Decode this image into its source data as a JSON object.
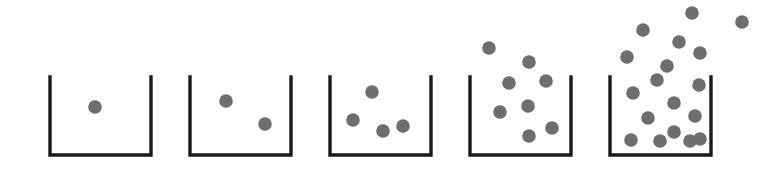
{
  "figure": {
    "width": 775,
    "height": 183,
    "background_color": "#ffffff"
  },
  "style": {
    "container_stroke_color": "#1a1a1a",
    "container_stroke_width": 3.4,
    "particle_color": "#6e6e6e",
    "particle_radius": 6.8
  },
  "chart_data": {
    "type": "scatter",
    "xlabel": "",
    "ylabel": "",
    "grid": false,
    "legend": null,
    "categories": [
      "Container 1",
      "Container 2",
      "Container 3",
      "Container 4",
      "Container 5"
    ],
    "series": [
      {
        "name": "Particles inside container",
        "values": [
          1,
          2,
          4,
          6,
          11
        ]
      },
      {
        "name": "Particles escaped above rim",
        "values": [
          0,
          0,
          0,
          2,
          7
        ]
      },
      {
        "name": "Total particles",
        "values": [
          1,
          2,
          4,
          8,
          18
        ]
      }
    ],
    "axis_note": "No axes drawn; quantities read by counting drawn particles."
  },
  "containers": [
    {
      "label": "Container 1",
      "particle_count_total": 1,
      "particle_count_inside": 1,
      "particle_count_escaped": 0,
      "box": {
        "left": 50,
        "right": 151,
        "top": 77,
        "bottom": 155
      },
      "particles_inside": [
        {
          "cx": 95,
          "cy": 107
        }
      ],
      "particles_escaped": []
    },
    {
      "label": "Container 2",
      "particle_count_total": 2,
      "particle_count_inside": 2,
      "particle_count_escaped": 0,
      "box": {
        "left": 190,
        "right": 291,
        "top": 77,
        "bottom": 155
      },
      "particles_inside": [
        {
          "cx": 226,
          "cy": 101
        },
        {
          "cx": 265,
          "cy": 124
        }
      ],
      "particles_escaped": []
    },
    {
      "label": "Container 3",
      "particle_count_total": 4,
      "particle_count_inside": 4,
      "particle_count_escaped": 0,
      "box": {
        "left": 330,
        "right": 431,
        "top": 77,
        "bottom": 155
      },
      "particles_inside": [
        {
          "cx": 372,
          "cy": 92
        },
        {
          "cx": 353,
          "cy": 120
        },
        {
          "cx": 383,
          "cy": 131
        },
        {
          "cx": 403,
          "cy": 126
        }
      ],
      "particles_escaped": []
    },
    {
      "label": "Container 4",
      "particle_count_total": 8,
      "particle_count_inside": 6,
      "particle_count_escaped": 2,
      "box": {
        "left": 470,
        "right": 571,
        "top": 77,
        "bottom": 155
      },
      "particles_inside": [
        {
          "cx": 509,
          "cy": 83
        },
        {
          "cx": 546,
          "cy": 81
        },
        {
          "cx": 500,
          "cy": 112
        },
        {
          "cx": 528,
          "cy": 106
        },
        {
          "cx": 529,
          "cy": 136
        },
        {
          "cx": 552,
          "cy": 128
        }
      ],
      "particles_escaped": [
        {
          "cx": 489,
          "cy": 48
        },
        {
          "cx": 529,
          "cy": 62
        }
      ]
    },
    {
      "label": "Container 5",
      "particle_count_total": 18,
      "particle_count_inside": 11,
      "particle_count_escaped": 7,
      "box": {
        "left": 610,
        "right": 711,
        "top": 77,
        "bottom": 155
      },
      "particles_inside": [
        {
          "cx": 657,
          "cy": 80
        },
        {
          "cx": 699,
          "cy": 85
        },
        {
          "cx": 633,
          "cy": 93
        },
        {
          "cx": 674,
          "cy": 103
        },
        {
          "cx": 695,
          "cy": 116
        },
        {
          "cx": 648,
          "cy": 118
        },
        {
          "cx": 674,
          "cy": 132
        },
        {
          "cx": 700,
          "cy": 139
        },
        {
          "cx": 631,
          "cy": 140
        },
        {
          "cx": 660,
          "cy": 141
        },
        {
          "cx": 690,
          "cy": 141
        }
      ],
      "particles_escaped": [
        {
          "cx": 692,
          "cy": 13
        },
        {
          "cx": 742,
          "cy": 22
        },
        {
          "cx": 643,
          "cy": 30
        },
        {
          "cx": 679,
          "cy": 42
        },
        {
          "cx": 700,
          "cy": 53
        },
        {
          "cx": 627,
          "cy": 57
        },
        {
          "cx": 667,
          "cy": 66
        }
      ]
    }
  ]
}
